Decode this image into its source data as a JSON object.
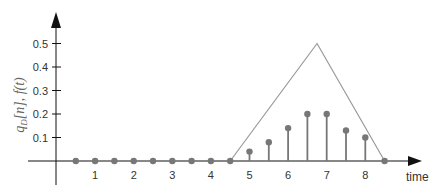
{
  "chart_data": {
    "type": "line",
    "title": "",
    "xlabel": "time",
    "ylabel": "q_D[n], f(t)",
    "x_ticks": [
      1,
      2,
      3,
      4,
      5,
      6,
      7,
      8
    ],
    "y_ticks": [
      0.1,
      0.2,
      0.3,
      0.4,
      0.5
    ],
    "xlim": [
      -0.5,
      9.5
    ],
    "ylim": [
      -0.1,
      0.6
    ],
    "grid": false,
    "series": [
      {
        "name": "f(t)",
        "kind": "continuous triangle",
        "x": [
          0,
          4.5,
          6.75,
          8.5,
          9.5
        ],
        "values": [
          0,
          0,
          0.5,
          0,
          0
        ]
      },
      {
        "name": "q_D[n]",
        "kind": "stem",
        "x": [
          0.5,
          1,
          1.5,
          2,
          2.5,
          3,
          3.5,
          4,
          4.5,
          5,
          5.5,
          6,
          6.5,
          7,
          7.5,
          8,
          8.5
        ],
        "values": [
          0,
          0,
          0,
          0,
          0,
          0,
          0,
          0,
          0,
          0.04,
          0.08,
          0.14,
          0.2,
          0.2,
          0.13,
          0.1,
          0
        ]
      }
    ],
    "colors": {
      "axis": "#111111",
      "triangle": "#999999",
      "stem": "#777777",
      "dot": "#777777"
    }
  },
  "labels": {
    "x_title": "time",
    "y_title_main": "q",
    "y_title_sub": "D",
    "y_title_rest": "[n], f(t)",
    "y_ticks": [
      "0.1",
      "0.2",
      "0.3",
      "0.4",
      "0.5"
    ],
    "x_ticks": [
      "1",
      "2",
      "3",
      "4",
      "5",
      "6",
      "7",
      "8"
    ]
  }
}
